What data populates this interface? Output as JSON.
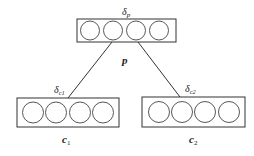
{
  "diagram": {
    "nodes": [
      {
        "id": "p",
        "label": "p",
        "delta_label": "δ",
        "delta_sub": "p",
        "units": 4,
        "box": {
          "x": 77,
          "y": 19,
          "w": 99,
          "h": 23
        }
      },
      {
        "id": "c1",
        "label": "c",
        "label_sub": "1",
        "delta_label": "δ",
        "delta_sub": "c1",
        "units": 4,
        "box": {
          "x": 17,
          "y": 98,
          "w": 102,
          "h": 29
        }
      },
      {
        "id": "c2",
        "label": "c",
        "label_sub": "2",
        "delta_label": "δ",
        "delta_sub": "c2",
        "units": 4,
        "box": {
          "x": 142,
          "y": 97,
          "w": 103,
          "h": 30
        }
      }
    ],
    "edges": [
      {
        "from": "p",
        "to": "c1"
      },
      {
        "from": "p",
        "to": "c2"
      }
    ],
    "colors": {
      "stroke": "#333333",
      "background": "#ffffff"
    }
  }
}
